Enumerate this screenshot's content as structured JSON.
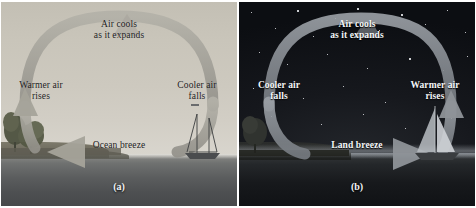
{
  "figure": {
    "panels": [
      {
        "id": "panel-day",
        "caption": "(a)",
        "scene": "daytime coastal scene with land on the left and ocean on the right",
        "breeze_name": "Ocean breeze",
        "labels": {
          "top_line1": "Air cools",
          "top_line2": "as it expands",
          "left_line1": "Warmer air",
          "left_line2": "rises",
          "right_line1": "Cooler air",
          "right_line2": "falls",
          "bottom": "Ocean breeze"
        },
        "objects": [
          "tree",
          "tree",
          "sailboat"
        ],
        "colors": {
          "sky_top": "#c3bfb4",
          "sky_bottom": "#d8d5cd",
          "sea_top": "#8e8e8a",
          "sea_bottom": "#47494b",
          "land": "#6d6a5d",
          "arrow": "#9c9a92",
          "text": "#1b1b1b"
        }
      },
      {
        "id": "panel-night",
        "caption": "(b)",
        "scene": "nighttime coastal scene with stars, land on the left and ocean on the right",
        "breeze_name": "Land breeze",
        "labels": {
          "top_line1": "Air cools",
          "top_line2": "as it expands",
          "left_line1": "Cooler air",
          "left_line2": "falls",
          "right_line1": "Warmer air",
          "right_line2": "rises",
          "bottom": "Land breeze"
        },
        "objects": [
          "tree",
          "sailboat",
          "stars"
        ],
        "colors": {
          "sky_top": "#0c0e12",
          "sky_bottom": "#23262b",
          "sea_top": "#35383a",
          "sea_bottom": "#101215",
          "land": "#1e201f",
          "arrow": "#8e9298",
          "text": "#f4f6f8"
        }
      }
    ]
  }
}
